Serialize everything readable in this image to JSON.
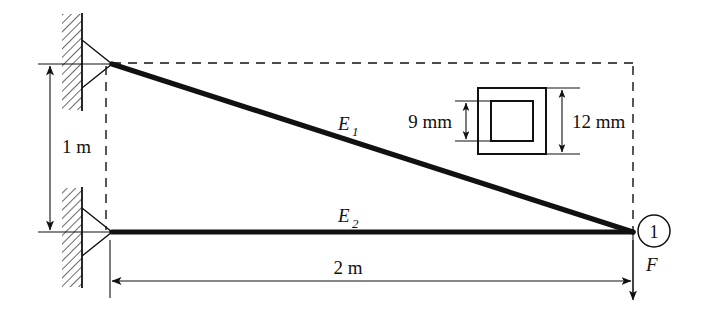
{
  "figure": {
    "type": "engineering-diagram",
    "canvas": {
      "width": 713,
      "height": 321
    },
    "background_color": "#ffffff",
    "line_color": "#111111"
  },
  "labels": {
    "height_dimension": "1 m",
    "length_dimension": "2 m",
    "member_top": "E",
    "member_top_sub": "1",
    "member_bottom": "E",
    "member_bottom_sub": "2",
    "node_number": "1",
    "force": "F",
    "inner_dimension": "9 mm",
    "outer_dimension": "12 mm"
  },
  "geometry": {
    "top_support_node": {
      "x": 112,
      "y": 64
    },
    "bottom_support_node": {
      "x": 112,
      "y": 232
    },
    "load_node": {
      "x": 633,
      "y": 232
    },
    "span_meters": 2,
    "height_meters": 1
  },
  "cross_section": {
    "shape": "hollow-square-tube",
    "outer_size_mm": 12,
    "inner_size_mm": 9,
    "outer": {
      "x": 478,
      "y": 88,
      "w": 68,
      "h": 66
    },
    "inner": {
      "x": 491,
      "y": 101,
      "w": 42,
      "h": 40
    }
  },
  "supports": [
    {
      "name": "upper-pin-support",
      "type": "pin",
      "wall": {
        "x": 62,
        "y": 14,
        "w": 20,
        "h": 96
      }
    },
    {
      "name": "lower-pin-support",
      "type": "pin",
      "wall": {
        "x": 62,
        "y": 188,
        "w": 20,
        "h": 99
      }
    }
  ]
}
